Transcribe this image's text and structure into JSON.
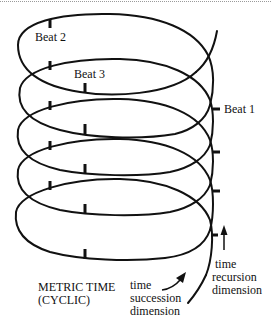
{
  "figure": {
    "title": "METRIC TIME",
    "subtitle": "(CYCLIC)",
    "beat_labels": {
      "beat1": "Beat 1",
      "beat2": "Beat 2",
      "beat3": "Beat 3"
    },
    "succession_label": [
      "time",
      "succession",
      "dimension"
    ],
    "recursion_label": [
      "time",
      "recursion",
      "dimension"
    ],
    "loop_count": 5,
    "stroke_color": "#111111",
    "background": "#ffffff"
  }
}
